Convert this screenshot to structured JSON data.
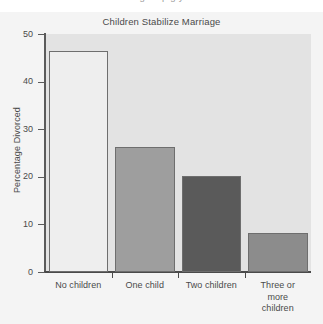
{
  "figure": {
    "clipped_caption": "gure  p  g  y        ",
    "background_color": "#f4f4f4",
    "plot_background_color": "#e3e3e3",
    "axis_color": "#4a4a4a",
    "text_color": "#4a4a4a"
  },
  "chart_data": {
    "type": "bar",
    "title": "Children Stabilize Marriage",
    "xlabel": "",
    "ylabel": "Percentage Divorced",
    "categories": [
      "No children",
      "One child",
      "Two children",
      "Three or more children"
    ],
    "category_lines": [
      [
        "No children"
      ],
      [
        "One child"
      ],
      [
        "Two children"
      ],
      [
        "Three or",
        "more",
        "children"
      ]
    ],
    "values": [
      46.5,
      26.2,
      20.1,
      8.1
    ],
    "bar_colors": [
      "#eeeeee",
      "#9e9e9e",
      "#5a5a5a",
      "#8c8c8c"
    ],
    "bar_edge_color": "#6e6e6e",
    "ylim": [
      0,
      50
    ],
    "yticks": [
      0,
      10,
      20,
      30,
      40,
      50
    ],
    "ytick_labels": [
      "0",
      "10",
      "20",
      "30",
      "40",
      "50"
    ],
    "grid": false,
    "legend": false
  }
}
